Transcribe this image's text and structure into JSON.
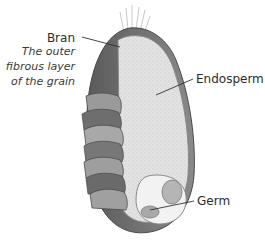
{
  "diagram": {
    "colors": {
      "bran": "#7d7d7d",
      "bran_dark": "#555555",
      "endosperm": "#dcdcdc",
      "germ": "#b8b8b8",
      "leader_line": "#333333",
      "text": "#2b2b2b"
    },
    "labels": {
      "bran": {
        "title": "Bran",
        "description_lines": [
          "The outer",
          "fibrous layer",
          "of the grain"
        ]
      },
      "endosperm": {
        "title": "Endosperm"
      },
      "germ": {
        "title": "Germ"
      }
    }
  }
}
